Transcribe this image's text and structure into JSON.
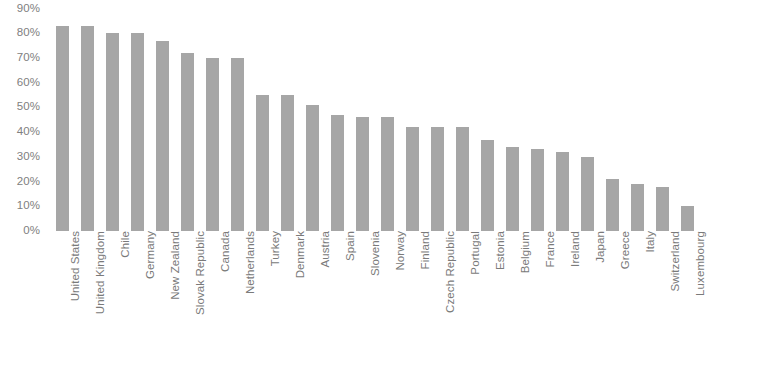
{
  "chart_data": {
    "type": "bar",
    "title": "",
    "subtitle": "",
    "xlabel": "",
    "ylabel": "",
    "ylim": [
      0,
      90
    ],
    "grid": false,
    "legend": null,
    "bar_color": "#a6a6a6",
    "axis_text_color": "#808080",
    "value_suffix": "%",
    "y_ticks": [
      "90%",
      "80%",
      "70%",
      "60%",
      "50%",
      "40%",
      "30%",
      "20%",
      "10%",
      "0%"
    ],
    "y_tick_values": [
      90,
      80,
      70,
      60,
      50,
      40,
      30,
      20,
      10,
      0
    ],
    "categories": [
      "United States",
      "United Kingdom",
      "Chile",
      "Germany",
      "New Zealand",
      "Slovak Republic",
      "Canada",
      "Netherlands",
      "Turkey",
      "Denmark",
      "Austria",
      "Spain",
      "Slovenia",
      "Norway",
      "Finland",
      "Czech Republic",
      "Portugal",
      "Estonia",
      "Belgium",
      "France",
      "Ireland",
      "Japan",
      "Greece",
      "Italy",
      "Switzerland",
      "Luxembourg"
    ],
    "values": [
      83,
      83,
      80,
      80,
      77,
      72,
      70,
      70,
      55,
      55,
      51,
      47,
      46,
      46,
      42,
      42,
      42,
      37,
      34,
      33,
      32,
      30,
      21,
      19,
      18,
      10
    ]
  }
}
